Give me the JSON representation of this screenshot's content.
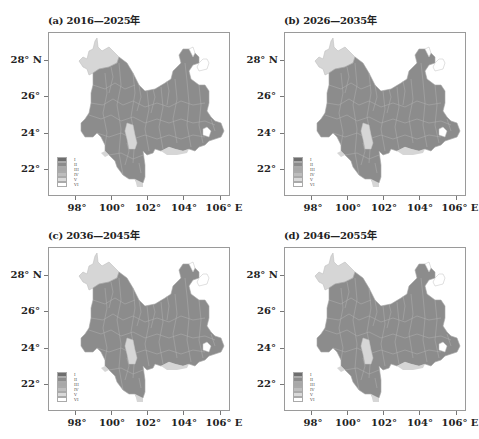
{
  "figure": {
    "panels": [
      {
        "id": "a",
        "title": "(a) 2016—2025年"
      },
      {
        "id": "b",
        "title": "(b) 2026—2035年"
      },
      {
        "id": "c",
        "title": "(c) 2036—2045年"
      },
      {
        "id": "d",
        "title": "(d) 2046—2055年"
      }
    ],
    "axes": {
      "x_ticks": [
        "98°",
        "100°",
        "102°",
        "104°",
        "106° E"
      ],
      "y_ticks": [
        "28° N",
        "26°",
        "24°",
        "22°"
      ]
    },
    "legend": {
      "classes": [
        "I",
        "II",
        "III",
        "IV",
        "V",
        "VI"
      ],
      "colors": [
        "#6e6e6e",
        "#8c8c8c",
        "#a8a8a8",
        "#bdbdbd",
        "#d9d9d9",
        "#ffffff"
      ]
    },
    "colors": {
      "main_fill": "#8c8c8c",
      "light_fill": "#d6d6d6",
      "boundary": "#b4b4b4",
      "frame": "#9a9a9a"
    }
  }
}
